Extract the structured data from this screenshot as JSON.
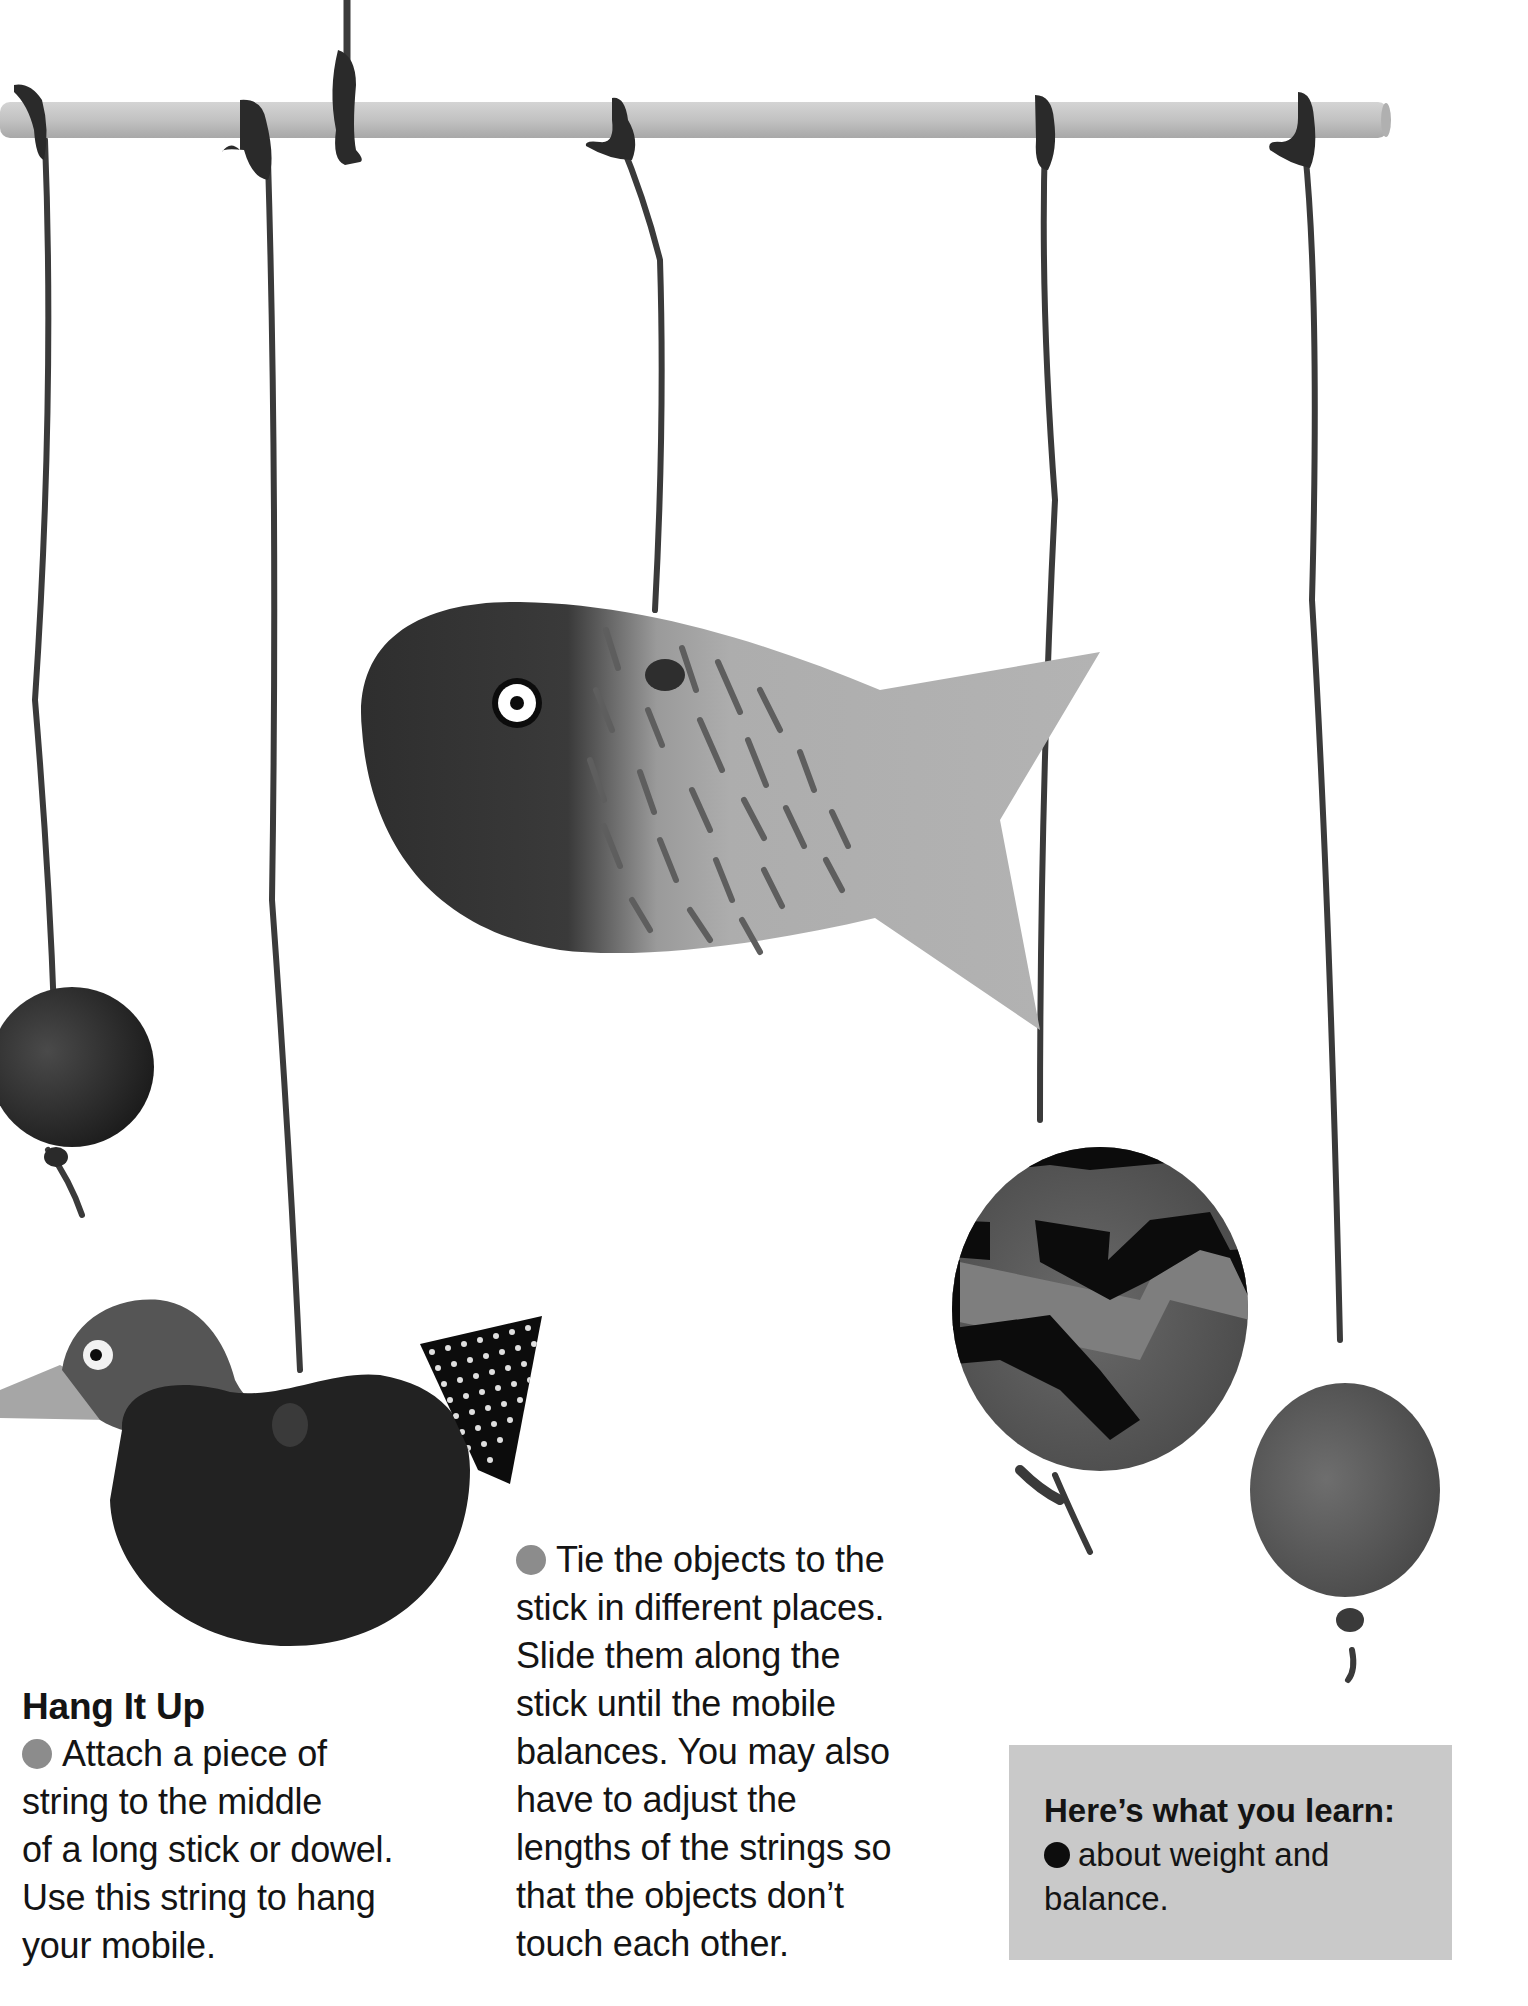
{
  "illustration": {
    "description": "Photo of a hanging mobile: wooden dowel with strings holding a fish, a bird, and three balls",
    "objects": [
      "dowel-stick",
      "dark-ball-left",
      "bird",
      "fish",
      "zigzag-ball",
      "plain-ball-right"
    ]
  },
  "left_column": {
    "heading": "Hang It Up",
    "lines": [
      "Attach a piece of",
      "string to the middle",
      "of a long stick or dowel.",
      "Use this string to hang",
      "your mobile."
    ]
  },
  "middle_column": {
    "lines": [
      "Tie the objects to the",
      "stick in different places.",
      "Slide them along the",
      "stick until the mobile",
      "balances. You may also",
      "have to adjust the",
      "lengths of the strings so",
      "that the objects don’t",
      "touch each other."
    ]
  },
  "learn_box": {
    "heading": "Here’s what you learn:",
    "lines": [
      "about weight and",
      "balance."
    ]
  },
  "colors": {
    "bullet_grey": "#8c8c8c",
    "box_background": "#c9c9c9",
    "text": "#141414"
  }
}
